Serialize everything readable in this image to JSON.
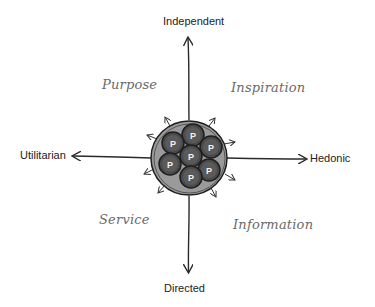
{
  "axes": {
    "top": "Independent",
    "bottom": "Directed",
    "left": "Utilitarian",
    "right": "Hedonic"
  },
  "quadrants": {
    "top_left": "Purpose",
    "top_right": "Inspiration",
    "bottom_left": "Service",
    "bottom_right": "Information"
  },
  "center_cluster": {
    "node_label": "P",
    "node_count": 7,
    "colors": {
      "outer_fill": "#9a9a9a",
      "node_fill": "#4a4a4a",
      "node_inner": "#6b6b6b",
      "stroke": "#1e1e1e"
    }
  },
  "colors": {
    "axis_line": "#2a2a2a",
    "axis_text": "#222222",
    "quadrant_text": "#6a6a6a"
  }
}
